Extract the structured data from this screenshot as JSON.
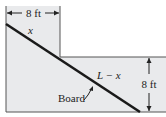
{
  "diagram": {
    "type": "corridor-board-figure",
    "colors": {
      "fill": "#e9eaec",
      "outline": "#555555",
      "board": "#1a1a1a",
      "text": "#222222"
    },
    "labels": {
      "top_width": "8 ft",
      "right_height": "8 ft",
      "upper_segment": "x",
      "lower_segment": "L − x",
      "board": "Board"
    }
  }
}
